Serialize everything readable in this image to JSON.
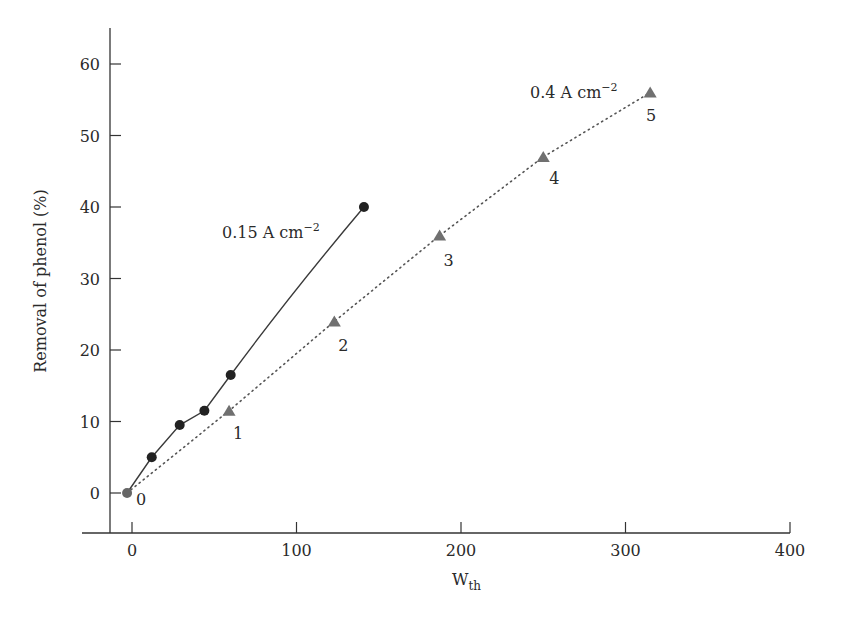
{
  "chart_data": {
    "type": "line",
    "title": "",
    "xlabel": "W",
    "xlabel_subscript": "th",
    "ylabel": "Removal of phenol (%)",
    "xlim": [
      -20,
      400
    ],
    "ylim": [
      -5,
      65
    ],
    "x_ticks": [
      0,
      100,
      200,
      300,
      400
    ],
    "y_ticks": [
      0,
      10,
      20,
      30,
      40,
      50,
      60
    ],
    "grid": false,
    "legend": "inline annotations",
    "series": [
      {
        "name": "0.15 A cm−2",
        "label_text": "0.15 A cm",
        "label_sup": "−2",
        "style": "solid line, filled circles",
        "marker": "circle",
        "color": "#222222",
        "x": [
          -3,
          12,
          29,
          44,
          60,
          141
        ],
        "y": [
          0,
          5,
          9.5,
          11.5,
          16.5,
          40
        ]
      },
      {
        "name": "0.4 A cm−2",
        "label_text": "0.4 A cm",
        "label_sup": "−2",
        "style": "dotted line, filled triangles",
        "marker": "triangle",
        "color": "#707070",
        "x": [
          -3,
          59,
          123,
          187,
          250,
          315
        ],
        "y": [
          0,
          11.5,
          24,
          36,
          47,
          56
        ],
        "point_labels": [
          "0",
          "1",
          "2",
          "3",
          "4",
          "5"
        ]
      }
    ]
  }
}
